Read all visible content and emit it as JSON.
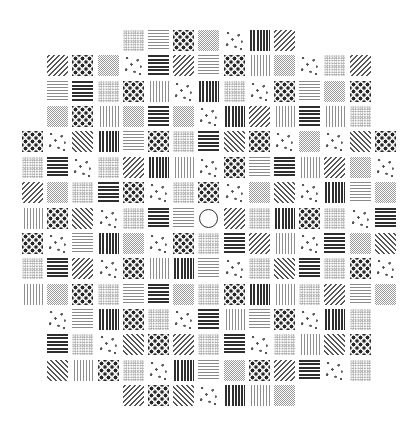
{
  "stimulus": {
    "type": "visual-search-texture-grid",
    "target": {
      "pattern": "circle",
      "row": 7,
      "col": 7
    },
    "layout": {
      "left": 22,
      "top": 30,
      "col_pitch": 25.2,
      "row_pitch": 25.35,
      "cell_size": 21
    },
    "pattern_legend": {
      "hlines": "thin horizontal lines",
      "hbold": "bold horizontal lines",
      "vlines": "thin vertical lines",
      "vbold": "bold vertical lines",
      "diagR": "rising diagonal lines",
      "diagL": "falling diagonal lines",
      "grid": "fine grey checker texture",
      "dots": "fine stipple texture",
      "checker": "checkerboard of large dots",
      "spots": "sparse scattered spots",
      "circle": "open ring (target)"
    },
    "rows": [
      {
        "start": 4,
        "cells": [
          "dots",
          "hlines",
          "checker",
          "grid",
          "spots",
          "vbold",
          "diagR"
        ]
      },
      {
        "start": 1,
        "cells": [
          "diagR",
          "checker",
          "grid",
          "spots",
          "hbold",
          "diagR",
          "hlines",
          "checker",
          "vlines",
          "grid",
          "spots",
          "dots",
          "diagR"
        ]
      },
      {
        "start": 1,
        "cells": [
          "hlines",
          "hbold",
          "dots",
          "checker",
          "vlines",
          "spots",
          "vbold",
          "dots",
          "spots",
          "checker",
          "hlines",
          "grid",
          "checker"
        ]
      },
      {
        "start": 1,
        "cells": [
          "grid",
          "checker",
          "vlines",
          "grid",
          "hbold",
          "grid",
          "spots",
          "vbold",
          "diagR",
          "vlines",
          "hbold",
          "vlines",
          "dots"
        ]
      },
      {
        "start": 0,
        "cells": [
          "checker",
          "spots",
          "diagL",
          "vbold",
          "hlines",
          "checker",
          "dots",
          "hbold",
          "diagL",
          "checker",
          "spots",
          "grid",
          "spots",
          "diagL",
          "checker"
        ]
      },
      {
        "start": 0,
        "cells": [
          "dots",
          "hbold",
          "spots",
          "dots",
          "diagR",
          "vbold",
          "vlines",
          "spots",
          "checker",
          "hlines",
          "hbold",
          "vlines",
          "diagR",
          "grid",
          "spots"
        ]
      },
      {
        "start": 0,
        "cells": [
          "diagR",
          "grid",
          "dots",
          "hbold",
          "checker",
          "spots",
          "dots",
          "checker",
          "spots",
          "grid",
          "diagL",
          "spots",
          "vbold",
          "hlines",
          "grid"
        ]
      },
      {
        "start": 0,
        "cells": [
          "vlines",
          "checker",
          "diagL",
          "spots",
          "dots",
          "hbold",
          "hlines",
          "circle",
          "diagR",
          "dots",
          "vbold",
          "checker",
          "dots",
          "spots",
          "hbold"
        ]
      },
      {
        "start": 0,
        "cells": [
          "checker",
          "spots",
          "hlines",
          "vbold",
          "grid",
          "spots",
          "checker",
          "dots",
          "hbold",
          "diagR",
          "vlines",
          "spots",
          "hbold",
          "grid",
          "diagL"
        ]
      },
      {
        "start": 0,
        "cells": [
          "dots",
          "hbold",
          "diagR",
          "spots",
          "checker",
          "vlines",
          "vbold",
          "hlines",
          "spots",
          "dots",
          "diagL",
          "hbold",
          "dots",
          "checker",
          "spots"
        ]
      },
      {
        "start": 0,
        "cells": [
          "vlines",
          "grid",
          "checker",
          "dots",
          "hlines",
          "hbold",
          "grid",
          "dots",
          "checker",
          "vbold",
          "vlines",
          "dots",
          "diagR",
          "hlines",
          "grid"
        ]
      },
      {
        "start": 1,
        "cells": [
          "spots",
          "hlines",
          "vbold",
          "checker",
          "dots",
          "spots",
          "hbold",
          "vlines",
          "hlines",
          "checker",
          "spots",
          "vbold",
          "dots"
        ]
      },
      {
        "start": 1,
        "cells": [
          "hbold",
          "dots",
          "spots",
          "diagL",
          "checker",
          "diagR",
          "dots",
          "hbold",
          "spots",
          "dots",
          "vlines",
          "diagL",
          "checker"
        ]
      },
      {
        "start": 1,
        "cells": [
          "diagL",
          "vlines",
          "checker",
          "dots",
          "spots",
          "vbold",
          "hlines",
          "grid",
          "checker",
          "diagR",
          "hbold",
          "spots",
          "dots"
        ]
      },
      {
        "start": 4,
        "cells": [
          "diagR",
          "checker",
          "diagL",
          "spots",
          "vbold",
          "vlines",
          "grid"
        ]
      }
    ]
  }
}
